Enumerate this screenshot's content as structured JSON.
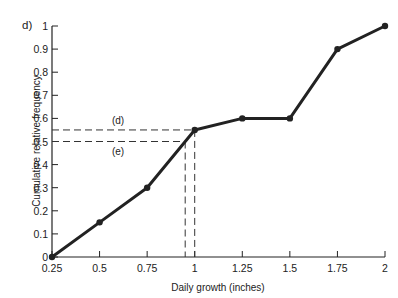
{
  "chart_data": {
    "type": "line",
    "title": "",
    "panel_label": "d)",
    "xlabel": "Daily growth (inches)",
    "ylabel": "Cumulative relative frequency",
    "x": [
      0.25,
      0.5,
      0.75,
      1.0,
      1.25,
      1.5,
      1.75,
      2.0
    ],
    "series": [
      {
        "name": "Cumulative relative frequency",
        "values": [
          0,
          0.15,
          0.3,
          0.55,
          0.6,
          0.6,
          0.9,
          1.0
        ]
      }
    ],
    "xlim": [
      0.25,
      2.0
    ],
    "ylim": [
      0,
      1
    ],
    "x_ticks": [
      "0.25",
      "0.5",
      "0.75",
      "1",
      "1.25",
      "1.5",
      "1.75",
      "2"
    ],
    "y_ticks": [
      "0",
      "0.1",
      "0.2",
      "0.3",
      "0.4",
      "0.5",
      "0.6",
      "0.7",
      "0.8",
      "0.9",
      "1"
    ],
    "grid": false,
    "legend": null,
    "annotations": [
      {
        "label": "(d)",
        "y": 0.55,
        "x": 1.0,
        "style": "dashed"
      },
      {
        "label": "(e)",
        "y": 0.5,
        "x": 0.95,
        "style": "dashed"
      }
    ]
  }
}
